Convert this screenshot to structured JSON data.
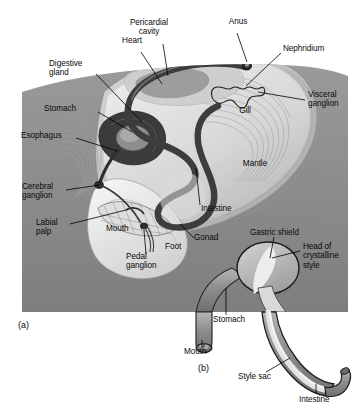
{
  "figure": {
    "panels": [
      {
        "tag": "(a)",
        "name": "whole-animal-panel"
      },
      {
        "tag": "(b)",
        "name": "stomach-detail-panel"
      }
    ],
    "colors": {
      "panel_background": "#8b8b8b",
      "body_light": "#e9e9e9",
      "body_mid": "#c9c9c9",
      "body_shadow": "#aaaaaa",
      "gut_dark": "#4a4a4a",
      "organ_mid": "#8f8f8f",
      "organ_pale": "#d8d8d8",
      "outline": "#1a1a1a",
      "label_text": "#0a0a0a",
      "leader_line": "#000000",
      "page": "#ffffff"
    }
  },
  "labels_a": [
    {
      "id": "pericardial-cavity",
      "text": "Pericardial\ncavity",
      "x": 148,
      "y": 22,
      "align": "center"
    },
    {
      "id": "anus",
      "text": "Anus",
      "x": 237,
      "y": 20,
      "align": "center"
    },
    {
      "id": "heart",
      "text": "Heart",
      "x": 130,
      "y": 39,
      "align": "center"
    },
    {
      "id": "nephridium",
      "text": "Nephridium",
      "x": 283,
      "y": 47,
      "align": "left"
    },
    {
      "id": "digestive-gland",
      "text": "Digestive\ngland",
      "x": 57,
      "y": 63,
      "align": "left"
    },
    {
      "id": "visceral-ganglion",
      "text": "Visceral\nganglion",
      "x": 307,
      "y": 95,
      "align": "left"
    },
    {
      "id": "stomach-a",
      "text": "Stomach",
      "x": 54,
      "y": 108,
      "align": "left"
    },
    {
      "id": "gill",
      "text": "Gill",
      "x": 245,
      "y": 110,
      "align": "center"
    },
    {
      "id": "esophagus",
      "text": "Esophagus",
      "x": 26,
      "y": 135,
      "align": "left"
    },
    {
      "id": "mantle",
      "text": "Mantle",
      "x": 254,
      "y": 163,
      "align": "center"
    },
    {
      "id": "cerebral-ganglion",
      "text": "Cerebral\nganglion",
      "x": 28,
      "y": 186,
      "align": "left"
    },
    {
      "id": "intestine-a",
      "text": "Intestine",
      "x": 202,
      "y": 207,
      "align": "left"
    },
    {
      "id": "labial-palp",
      "text": "Labial\npalp",
      "x": 39,
      "y": 221,
      "align": "left"
    },
    {
      "id": "mouth-a",
      "text": "Mouth",
      "x": 110,
      "y": 227,
      "align": "left"
    },
    {
      "id": "gonad",
      "text": "Gonad",
      "x": 196,
      "y": 237,
      "align": "left"
    },
    {
      "id": "foot",
      "text": "Foot",
      "x": 166,
      "y": 245,
      "align": "left"
    },
    {
      "id": "pedal-ganglion",
      "text": "Pedal\nganglion",
      "x": 131,
      "y": 255,
      "align": "left"
    }
  ],
  "labels_b": [
    {
      "id": "gastric-shield",
      "text": "Gastric shield",
      "x": 253,
      "y": 231,
      "align": "left"
    },
    {
      "id": "head-of-crystalline-style",
      "text": "Head of\ncrystalline\nstyle",
      "x": 303,
      "y": 245,
      "align": "left"
    },
    {
      "id": "stomach-b",
      "text": "Stomach",
      "x": 215,
      "y": 318,
      "align": "left"
    },
    {
      "id": "mouth-b",
      "text": "Mouth",
      "x": 185,
      "y": 350,
      "align": "left"
    },
    {
      "id": "style-sac",
      "text": "Style sac",
      "x": 240,
      "y": 375,
      "align": "left"
    },
    {
      "id": "intestine-b",
      "text": "Intestine",
      "x": 300,
      "y": 398,
      "align": "left"
    }
  ],
  "panel_tags": [
    {
      "id": "panel-a-tag",
      "text": "(a)",
      "x": 18,
      "y": 323
    },
    {
      "id": "panel-b-tag",
      "text": "(b)",
      "x": 198,
      "y": 366
    }
  ]
}
